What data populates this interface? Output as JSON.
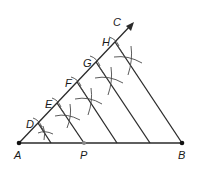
{
  "diagram": {
    "colors": {
      "line": "#2a2a2a",
      "arc": "#4a4a4a",
      "point": "#111111",
      "point_p": "#888888",
      "background": "#ffffff"
    },
    "labels": {
      "A": "A",
      "B": "B",
      "C": "C",
      "D": "D",
      "E": "E",
      "F": "F",
      "G": "G",
      "H": "H",
      "P": "P"
    },
    "points": {
      "A": [
        19,
        143
      ],
      "B": [
        182,
        143
      ],
      "P": [
        84,
        143
      ],
      "C_arrow_tip": [
        134,
        22
      ],
      "D": [
        38,
        123
      ],
      "E": [
        57,
        103
      ],
      "F": [
        77,
        82
      ],
      "G": [
        96,
        62
      ],
      "H": [
        115,
        42
      ]
    },
    "segments": [
      {
        "name": "AB",
        "from": "A",
        "to": "B"
      },
      {
        "name": "ray-AC",
        "from": "A",
        "to": "C_arrow_tip"
      },
      {
        "name": "parallel-D",
        "from": "D",
        "to": [
          51,
          143
        ]
      },
      {
        "name": "parallel-E",
        "from": "E",
        "to": "P"
      },
      {
        "name": "parallel-F",
        "from": "F",
        "to": [
          117,
          143
        ]
      },
      {
        "name": "parallel-G",
        "from": "G",
        "to": [
          150,
          143
        ]
      },
      {
        "name": "parallel-H",
        "from": "H",
        "to": "B"
      }
    ]
  }
}
